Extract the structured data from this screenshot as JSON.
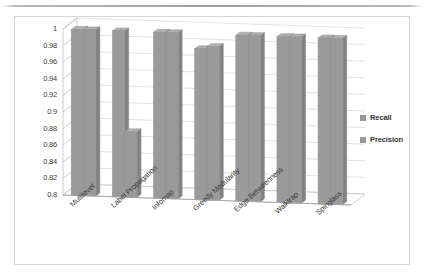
{
  "chart_data": {
    "type": "bar",
    "title": "",
    "xlabel": "",
    "ylabel": "",
    "categories": [
      "Multilevel",
      "Label Propagation",
      "Infomap",
      "Greedy Modularity",
      "Edge Betweenness",
      "Walktrap",
      "Spinglass"
    ],
    "series": [
      {
        "name": "Recall",
        "values": [
          1,
          1,
          1,
          0.982,
          1,
          1,
          1
        ]
      },
      {
        "name": "Precision",
        "values": [
          1,
          0.879,
          1,
          0.985,
          1,
          1,
          1
        ]
      }
    ],
    "ylim": [
      0.8,
      1
    ],
    "ytick_labels": [
      "1",
      "0.98",
      "0.96",
      "0.94",
      "0.92",
      "0.9",
      "0.88",
      "0.86",
      "0.84",
      "0.82",
      "0.8"
    ],
    "ytick_values": [
      1,
      0.98,
      0.96,
      0.94,
      0.92,
      0.9,
      0.88,
      0.86,
      0.84,
      0.82,
      0.8
    ],
    "grid": true,
    "legend_position": "right",
    "bar_color": "#9a9a9a",
    "bar_side_color": "#828282",
    "bar_top_color": "#b0b0b0",
    "gridline_color": "#d9d9d9",
    "axis_color": "#bfbfbf",
    "frame_color": "#d6d6d6"
  },
  "legend": {
    "items": [
      {
        "label": "Recall"
      },
      {
        "label": "Precision"
      }
    ]
  }
}
